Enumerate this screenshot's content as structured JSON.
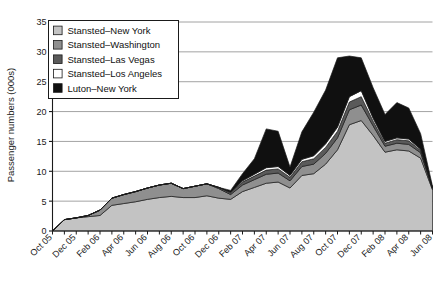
{
  "chart_data": {
    "type": "area",
    "stacked": true,
    "title": "",
    "xlabel": "",
    "ylabel": "Passenger numbers (000s)",
    "ylim": [
      0,
      35
    ],
    "ytick_step": 5,
    "yticks": [
      "0",
      "5",
      "10",
      "15",
      "20",
      "25",
      "30",
      "35"
    ],
    "grid": true,
    "grid_axis": "y",
    "legend_position": "top-left",
    "x": [
      "Oct 05",
      "Nov 05",
      "Dec 05",
      "Jan 06",
      "Feb 06",
      "Mar 06",
      "Apr 06",
      "May 06",
      "Jun 06",
      "Jul 06",
      "Aug 06",
      "Sep 06",
      "Oct 06",
      "Nov 06",
      "Dec 06",
      "Jan 07",
      "Feb 07",
      "Mar 07",
      "Apr 07",
      "May 07",
      "Jun 07",
      "Jul 07",
      "Aug 07",
      "Sep 07",
      "Oct 07",
      "Nov 07",
      "Dec 07",
      "Jan 08",
      "Feb 08",
      "Mar 08",
      "Apr 08",
      "May 08",
      "Jun 08"
    ],
    "xtick_labels": [
      "Oct 05",
      "",
      "Dec 05",
      "",
      "Feb 06",
      "",
      "Apr 06",
      "",
      "Jun 06",
      "",
      "Aug 06",
      "",
      "Oct 06",
      "",
      "Dec 06",
      "",
      "Feb 07",
      "",
      "Apr 07",
      "",
      "Jun 07",
      "",
      "Aug 07",
      "",
      "Oct 07",
      "",
      "Dec 07",
      "",
      "Feb 08",
      "",
      "Apr 08",
      "",
      "Jun 08"
    ],
    "series": [
      {
        "name": "Stansted–New York",
        "color": "#c3c3c3",
        "values": [
          0.0,
          1.9,
          2.2,
          2.4,
          2.6,
          4.3,
          4.6,
          4.9,
          5.3,
          5.6,
          5.8,
          5.6,
          5.6,
          5.9,
          5.5,
          5.3,
          6.6,
          7.3,
          8.0,
          8.2,
          7.2,
          9.3,
          9.6,
          11.2,
          13.6,
          17.8,
          18.5,
          16.0,
          13.2,
          13.6,
          13.4,
          12.2,
          6.9
        ]
      },
      {
        "name": "Stansted–Washington",
        "color": "#8f8f8f",
        "values": [
          0.0,
          0.0,
          0.0,
          0.2,
          0.9,
          1.2,
          1.5,
          1.7,
          1.9,
          2.1,
          2.2,
          1.5,
          1.9,
          2.0,
          1.6,
          0.8,
          1.1,
          1.3,
          1.5,
          1.5,
          1.2,
          1.5,
          1.6,
          1.8,
          2.0,
          2.5,
          2.6,
          1.6,
          1.0,
          1.1,
          1.1,
          0.9,
          0.2
        ]
      },
      {
        "name": "Stansted–Las Vegas",
        "color": "#5a5a5a",
        "values": [
          0.0,
          0.0,
          0.0,
          0.0,
          0.0,
          0.0,
          0.0,
          0.0,
          0.0,
          0.0,
          0.0,
          0.0,
          0.0,
          0.0,
          0.2,
          0.3,
          0.5,
          0.6,
          0.7,
          0.7,
          0.6,
          0.8,
          0.9,
          1.0,
          1.1,
          1.3,
          1.4,
          0.8,
          0.5,
          0.6,
          0.6,
          0.4,
          0.1
        ]
      },
      {
        "name": "Stansted–Los Angeles",
        "color": "#ffffff",
        "values": [
          0.0,
          0.0,
          0.0,
          0.0,
          0.0,
          0.0,
          0.0,
          0.0,
          0.0,
          0.0,
          0.0,
          0.0,
          0.0,
          0.0,
          0.0,
          0.1,
          0.2,
          0.3,
          0.4,
          0.4,
          0.3,
          0.4,
          0.5,
          0.6,
          0.7,
          0.9,
          1.0,
          0.5,
          0.3,
          0.3,
          0.3,
          0.2,
          0.0
        ]
      },
      {
        "name": "Luton–New York",
        "color": "#101010",
        "values": [
          0.0,
          0.0,
          0.0,
          0.0,
          0.0,
          0.0,
          0.0,
          0.0,
          0.0,
          0.0,
          0.0,
          0.0,
          0.0,
          0.0,
          0.0,
          0.3,
          1.2,
          2.6,
          6.5,
          5.9,
          1.4,
          4.6,
          7.3,
          9.0,
          11.6,
          6.8,
          5.5,
          5.1,
          4.5,
          5.9,
          5.2,
          2.6,
          0.3
        ]
      }
    ],
    "legend_items": [
      {
        "label": "Stansted–New York",
        "color": "#c3c3c3"
      },
      {
        "label": "Stansted–Washington",
        "color": "#8f8f8f"
      },
      {
        "label": "Stansted–Las Vegas",
        "color": "#5a5a5a"
      },
      {
        "label": "Stansted–Los Angeles",
        "color": "#ffffff"
      },
      {
        "label": "Luton–New York",
        "color": "#101010"
      }
    ]
  }
}
